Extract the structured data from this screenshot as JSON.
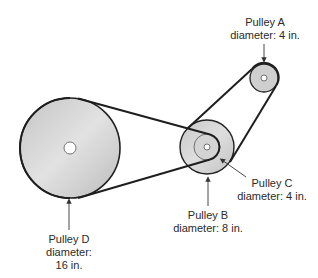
{
  "diagram": {
    "type": "belt-pulley-system",
    "colors": {
      "belt": "#1e1e1e",
      "pulley_fill_light": "#dcdcdc",
      "pulley_fill_dark": "#bdbdbd",
      "outline": "#222222",
      "text": "#2a2a2a",
      "background": "#ffffff"
    },
    "pulleys": [
      {
        "id": "A",
        "name": "Pulley A",
        "diameter_label": "diameter: 4 in.",
        "diameter_in": 4
      },
      {
        "id": "B",
        "name": "Pulley B",
        "diameter_label": "diameter: 8 in.",
        "diameter_in": 8
      },
      {
        "id": "C",
        "name": "Pulley C",
        "diameter_label": "diameter: 4 in.",
        "diameter_in": 4
      },
      {
        "id": "D",
        "name": "Pulley D",
        "diameter_label_line1": "diameter:",
        "diameter_label_line2": "16 in.",
        "diameter_in": 16
      }
    ],
    "belts": [
      {
        "connects": [
          "D",
          "C"
        ]
      },
      {
        "connects": [
          "B",
          "A"
        ]
      }
    ]
  }
}
